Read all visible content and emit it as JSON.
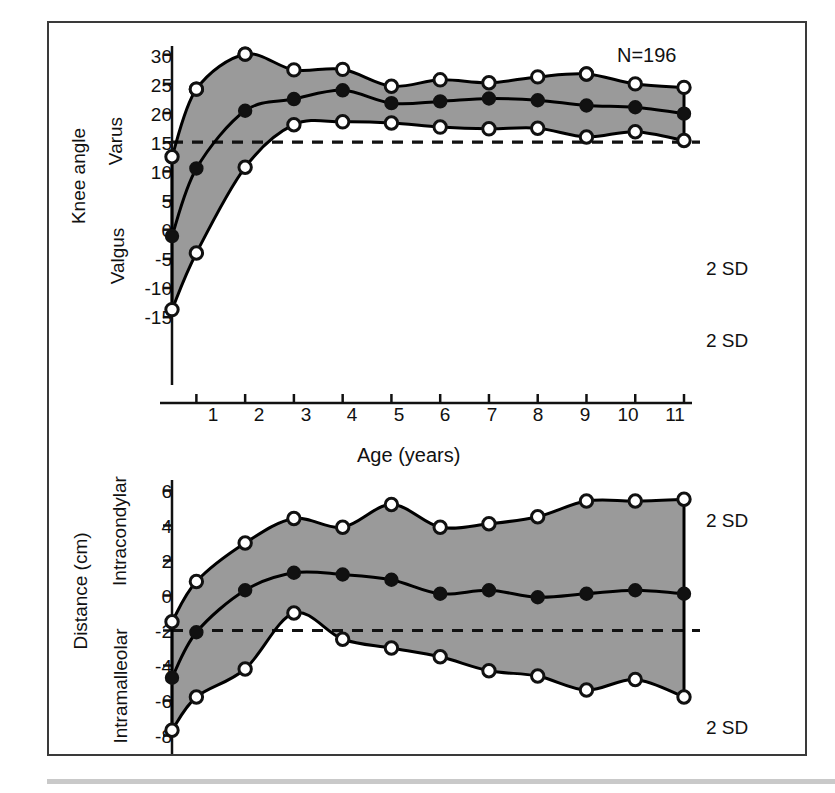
{
  "figure": {
    "annotation_n": "N=196",
    "axis_title_x": "Age (years)",
    "sd_label": "2 SD",
    "band_fill": "#9a9a9a",
    "line_color": "#000000",
    "frame_color": "#3a3a3a"
  },
  "panels": {
    "top": {
      "outer_y_label": "Knee angle",
      "inner_label_upper": "Varus",
      "inner_label_lower": "Valgus",
      "y_ticks": [
        30,
        25,
        20,
        15,
        10,
        5,
        0,
        -5,
        -10,
        -15
      ],
      "y_tick_labels": [
        "30",
        "25",
        "20",
        "15",
        "10",
        "5",
        "0",
        "-5",
        "-10",
        "-15"
      ],
      "x_ticks": [
        1,
        2,
        3,
        4,
        5,
        6,
        7,
        8,
        9,
        10,
        11
      ],
      "x_tick_labels": [
        "1",
        "2",
        "3",
        "4",
        "5",
        "6",
        "7",
        "8",
        "9",
        "10",
        "11"
      ],
      "sd_upper_label": "2 SD",
      "sd_lower_label": "2 SD",
      "zero_reference_line": 0
    },
    "bottom": {
      "outer_y_label": "Distance (cm)",
      "inner_label_upper": "Intracondylar",
      "inner_label_lower": "Intramalleolar",
      "y_ticks": [
        6,
        4,
        2,
        0,
        -2,
        -4,
        -6,
        -8
      ],
      "y_tick_labels": [
        "6",
        "4",
        "2",
        "0",
        "-2",
        "-4",
        "-6",
        "-8"
      ],
      "sd_upper_label": "2 SD",
      "sd_lower_label": "2 SD",
      "zero_reference_line": 0
    }
  },
  "chart_data": [
    {
      "type": "line",
      "id": "knee-angle-panel",
      "title": "Knee angle vs Age",
      "xlabel": "Age (years)",
      "ylabel": "Knee angle (degrees)",
      "xlim": [
        0.5,
        11
      ],
      "ylim": [
        -16.5,
        31
      ],
      "grid": false,
      "legend": "none",
      "annotations": [
        "N=196",
        "2 SD (upper)",
        "2 SD (lower)",
        "Varus",
        "Valgus"
      ],
      "zero_line": 0,
      "series": [
        {
          "name": "upper 2 SD curve",
          "style": "solid-line-with-open-markers",
          "x": [
            0.5,
            1,
            2,
            3,
            4,
            5,
            6,
            7,
            8,
            9,
            10,
            11
          ],
          "values": [
            28.7,
            19.0,
            4.3,
            -3.0,
            -3.5,
            -3.3,
            -2.6,
            -2.3,
            -2.4,
            -0.9,
            -1.8,
            -0.3
          ]
        },
        {
          "name": "mean curve",
          "style": "solid-line-with-filled-markers",
          "x": [
            0.5,
            1,
            2,
            3,
            4,
            5,
            6,
            7,
            8,
            9,
            10,
            11
          ],
          "values": [
            16.1,
            4.5,
            -5.4,
            -7.4,
            -8.9,
            -6.7,
            -7.0,
            -7.5,
            -7.2,
            -6.3,
            -6.0,
            -4.9
          ]
        },
        {
          "name": "lower 2 SD curve",
          "style": "solid-line-with-open-markers",
          "x": [
            0.5,
            1,
            2,
            3,
            4,
            5,
            6,
            7,
            8,
            9,
            10,
            11
          ],
          "values": [
            2.5,
            -9.1,
            -15.1,
            -12.4,
            -12.5,
            -9.6,
            -10.7,
            -10.2,
            -11.2,
            -11.7,
            -10.0,
            -9.4
          ]
        }
      ]
    },
    {
      "type": "line",
      "id": "distance-panel",
      "title": "Intracondylar / Intramalleolar distance vs Age",
      "xlabel": "Age (years)",
      "ylabel": "Distance (cm)",
      "xlim": [
        0.5,
        11
      ],
      "ylim": [
        -8.6,
        6.6
      ],
      "grid": false,
      "legend": "none",
      "annotations": [
        "2 SD (upper)",
        "2 SD (lower)",
        "Intracondylar",
        "Intramalleolar"
      ],
      "zero_line": 0,
      "series": [
        {
          "name": "upper 2 SD curve",
          "style": "solid-line-with-open-markers",
          "x": [
            0.5,
            1,
            2,
            3,
            4,
            5,
            6,
            7,
            8,
            9,
            10,
            11
          ],
          "values": [
            5.7,
            3.8,
            2.2,
            -1.0,
            0.5,
            1.0,
            1.5,
            2.3,
            2.6,
            3.4,
            2.8,
            3.8
          ]
        },
        {
          "name": "mean curve",
          "style": "solid-line-with-filled-markers",
          "x": [
            0.5,
            1,
            2,
            3,
            4,
            5,
            6,
            7,
            8,
            9,
            10,
            11
          ],
          "values": [
            2.7,
            0.1,
            -2.3,
            -3.3,
            -3.2,
            -2.9,
            -2.1,
            -2.3,
            -1.9,
            -2.1,
            -2.3,
            -2.1
          ]
        },
        {
          "name": "lower 2 SD curve",
          "style": "solid-line-with-open-markers",
          "x": [
            0.5,
            1,
            2,
            3,
            4,
            5,
            6,
            7,
            8,
            9,
            10,
            11
          ],
          "values": [
            -0.5,
            -2.8,
            -5.0,
            -6.4,
            -5.9,
            -7.2,
            -5.9,
            -6.1,
            -6.5,
            -7.4,
            -7.4,
            -7.5
          ]
        }
      ]
    }
  ]
}
